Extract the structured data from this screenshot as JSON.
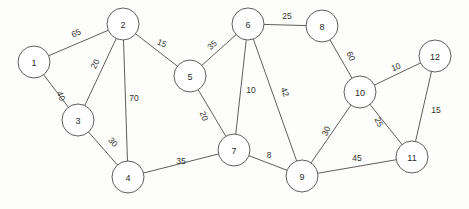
{
  "diagram": {
    "type": "node-link-graph",
    "canvas": {
      "width": 469,
      "height": 209
    },
    "style": {
      "background_color": "#fdfdfc",
      "node_fill": "#ffffff",
      "node_stroke": "#4c4c4c",
      "edge_stroke": "#4c4c4c",
      "label_color": "#2b2b2b",
      "node_radius": 16
    },
    "nodes": [
      {
        "id": "1",
        "label": "1",
        "x": 34,
        "y": 62,
        "r": 16
      },
      {
        "id": "2",
        "label": "2",
        "x": 123,
        "y": 24,
        "r": 16
      },
      {
        "id": "3",
        "label": "3",
        "x": 78,
        "y": 120,
        "r": 16
      },
      {
        "id": "4",
        "label": "4",
        "x": 128,
        "y": 177,
        "r": 16
      },
      {
        "id": "5",
        "label": "5",
        "x": 190,
        "y": 76,
        "r": 16
      },
      {
        "id": "6",
        "label": "6",
        "x": 248,
        "y": 24,
        "r": 16
      },
      {
        "id": "7",
        "label": "7",
        "x": 234,
        "y": 150,
        "r": 16
      },
      {
        "id": "8",
        "label": "8",
        "x": 322,
        "y": 26,
        "r": 16
      },
      {
        "id": "9",
        "label": "9",
        "x": 302,
        "y": 176,
        "r": 16
      },
      {
        "id": "10",
        "label": "10",
        "x": 360,
        "y": 92,
        "r": 16
      },
      {
        "id": "11",
        "label": "11",
        "x": 412,
        "y": 157,
        "r": 16
      },
      {
        "id": "12",
        "label": "12",
        "x": 435,
        "y": 56,
        "r": 16
      }
    ],
    "edges": [
      {
        "source": "1",
        "target": "2",
        "weight": "65",
        "lx": 76,
        "ly": 33,
        "rot": -24
      },
      {
        "source": "1",
        "target": "3",
        "weight": "40",
        "lx": 61,
        "ly": 96,
        "rot": 67
      },
      {
        "source": "2",
        "target": "3",
        "weight": "20",
        "lx": 95,
        "ly": 64,
        "rot": -63
      },
      {
        "source": "2",
        "target": "4",
        "weight": "70",
        "lx": 134,
        "ly": 98,
        "rot": 0
      },
      {
        "source": "2",
        "target": "5",
        "weight": "15",
        "lx": 162,
        "ly": 43,
        "rot": 23
      },
      {
        "source": "3",
        "target": "4",
        "weight": "30",
        "lx": 113,
        "ly": 142,
        "rot": 49
      },
      {
        "source": "4",
        "target": "7",
        "weight": "35",
        "lx": 181,
        "ly": 161,
        "rot": 0
      },
      {
        "source": "5",
        "target": "6",
        "weight": "35",
        "lx": 212,
        "ly": 45,
        "rot": -41
      },
      {
        "source": "5",
        "target": "7",
        "weight": "20",
        "lx": 204,
        "ly": 116,
        "rot": 70
      },
      {
        "source": "6",
        "target": "7",
        "weight": "10",
        "lx": 251,
        "ly": 90,
        "rot": 0
      },
      {
        "source": "6",
        "target": "8",
        "weight": "25",
        "lx": 287,
        "ly": 16,
        "rot": 0
      },
      {
        "source": "6",
        "target": "9",
        "weight": "42",
        "lx": 285,
        "ly": 92,
        "rot": 68
      },
      {
        "source": "7",
        "target": "9",
        "weight": "8",
        "lx": 269,
        "ly": 155,
        "rot": 0
      },
      {
        "source": "8",
        "target": "10",
        "weight": "60",
        "lx": 351,
        "ly": 56,
        "rot": 66
      },
      {
        "source": "9",
        "target": "10",
        "weight": "30",
        "lx": 326,
        "ly": 131,
        "rot": -65
      },
      {
        "source": "9",
        "target": "11",
        "weight": "45",
        "lx": 357,
        "ly": 158,
        "rot": 0
      },
      {
        "source": "10",
        "target": "11",
        "weight": "25",
        "lx": 379,
        "ly": 122,
        "rot": 65
      },
      {
        "source": "10",
        "target": "12",
        "weight": "10",
        "lx": 396,
        "ly": 67,
        "rot": -22
      },
      {
        "source": "11",
        "target": "12",
        "weight": "15",
        "lx": 436,
        "ly": 110,
        "rot": 0
      }
    ]
  }
}
